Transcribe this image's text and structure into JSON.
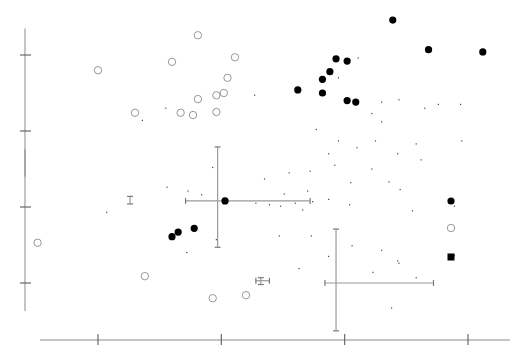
{
  "chart_data": {
    "type": "scatter",
    "title": "",
    "xlabel": "",
    "ylabel": "",
    "x_ticks": [
      1,
      2,
      3,
      4
    ],
    "x_tick_labels": [],
    "y_ticks": [
      1,
      2,
      3,
      4
    ],
    "y_tick_labels": [],
    "xlim": [
      0.53,
      4.34
    ],
    "ylim": [
      0.77,
      4.5
    ],
    "y_axis_segments": [
      [
        0.63,
        2.76
      ],
      [
        2.4,
        4.35
      ]
    ],
    "grid": false,
    "legend": {
      "placement": "right",
      "entries": [
        {
          "marker": "filled-circle",
          "label": ""
        },
        {
          "marker": "open-circle",
          "label": ""
        },
        {
          "marker": "filled-square",
          "label": ""
        }
      ]
    },
    "series": [
      {
        "name": "filled-circles",
        "marker": "filled-circle",
        "points": [
          [
            3.39,
            4.46
          ],
          [
            3.68,
            4.07
          ],
          [
            4.12,
            4.04
          ],
          [
            2.93,
            3.95
          ],
          [
            3.02,
            3.92
          ],
          [
            2.88,
            3.78
          ],
          [
            2.82,
            3.68
          ],
          [
            2.62,
            3.54
          ],
          [
            2.82,
            3.5
          ],
          [
            3.02,
            3.4
          ],
          [
            3.09,
            3.38
          ],
          [
            2.03,
            2.08
          ],
          [
            1.6,
            1.61
          ],
          [
            1.65,
            1.67
          ],
          [
            1.78,
            1.72
          ]
        ]
      },
      {
        "name": "open-circles",
        "marker": "open-circle",
        "points": [
          [
            1.0,
            3.8
          ],
          [
            1.6,
            3.91
          ],
          [
            1.81,
            4.26
          ],
          [
            2.11,
            3.97
          ],
          [
            2.05,
            3.7
          ],
          [
            1.96,
            3.47
          ],
          [
            2.02,
            3.5
          ],
          [
            1.81,
            3.42
          ],
          [
            1.96,
            3.25
          ],
          [
            1.67,
            3.24
          ],
          [
            1.77,
            3.21
          ],
          [
            1.3,
            3.24
          ],
          [
            0.51,
            1.53
          ],
          [
            1.38,
            1.09
          ],
          [
            1.93,
            0.8
          ],
          [
            2.2,
            0.84
          ]
        ]
      },
      {
        "name": "small-dots",
        "marker": "dot",
        "points": [
          [
            1.55,
            3.3
          ],
          [
            1.36,
            3.14
          ],
          [
            2.27,
            3.47
          ],
          [
            2.95,
            3.7
          ],
          [
            3.11,
            3.96
          ],
          [
            3.3,
            3.38
          ],
          [
            3.22,
            3.23
          ],
          [
            3.44,
            3.41
          ],
          [
            3.76,
            3.35
          ],
          [
            3.94,
            3.35
          ],
          [
            3.65,
            3.3
          ],
          [
            3.3,
            3.12
          ],
          [
            2.77,
            3.02
          ],
          [
            2.95,
            2.87
          ],
          [
            3.25,
            2.87
          ],
          [
            2.87,
            2.7
          ],
          [
            3.1,
            2.78
          ],
          [
            3.43,
            2.7
          ],
          [
            3.62,
            2.62
          ],
          [
            3.22,
            2.5
          ],
          [
            3.05,
            2.32
          ],
          [
            3.36,
            2.33
          ],
          [
            2.72,
            2.47
          ],
          [
            2.55,
            2.45
          ],
          [
            2.74,
            2.07
          ],
          [
            2.92,
            2.55
          ],
          [
            2.35,
            2.37
          ],
          [
            2.51,
            2.17
          ],
          [
            2.7,
            2.21
          ],
          [
            2.87,
            2.1
          ],
          [
            3.45,
            2.23
          ],
          [
            3.89,
            2.01
          ],
          [
            3.55,
            1.95
          ],
          [
            3.04,
            2.03
          ],
          [
            2.28,
            2.05
          ],
          [
            2.39,
            2.03
          ],
          [
            2.48,
            2.01
          ],
          [
            2.6,
            2.05
          ],
          [
            2.66,
            1.96
          ],
          [
            1.93,
            2.52
          ],
          [
            1.73,
            2.21
          ],
          [
            1.84,
            2.16
          ],
          [
            1.56,
            2.26
          ],
          [
            1.07,
            1.93
          ],
          [
            1.72,
            1.4
          ],
          [
            1.96,
            1.57
          ],
          [
            2.47,
            1.62
          ],
          [
            2.73,
            1.62
          ],
          [
            2.63,
            1.19
          ],
          [
            2.87,
            1.35
          ],
          [
            3.06,
            1.49
          ],
          [
            3.3,
            1.43
          ],
          [
            3.43,
            1.29
          ],
          [
            3.23,
            1.14
          ],
          [
            3.44,
            1.26
          ],
          [
            3.38,
            0.67
          ],
          [
            3.58,
            1.07
          ],
          [
            3.89,
            1.36
          ],
          [
            3.58,
            2.83
          ],
          [
            3.95,
            2.87
          ]
        ]
      }
    ],
    "error_bars": [
      {
        "center": [
          1.97,
          2.08
        ],
        "x_range": [
          1.71,
          2.72
        ],
        "y_range": [
          1.47,
          2.79
        ]
      },
      {
        "center": [
          2.93,
          1.0
        ],
        "x_range": [
          2.84,
          3.72
        ],
        "y_range": [
          0.37,
          1.71
        ]
      },
      {
        "center": [
          1.26,
          2.08
        ],
        "x_range": [
          1.26,
          1.26
        ],
        "y_range": [
          2.04,
          2.14
        ]
      },
      {
        "center": [
          2.32,
          1.03
        ],
        "x_range": [
          2.28,
          2.39
        ],
        "y_range": [
          0.98,
          1.07
        ]
      }
    ]
  }
}
